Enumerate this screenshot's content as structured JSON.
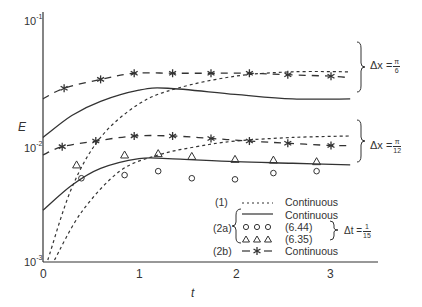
{
  "chart_data": {
    "type": "line",
    "title": "",
    "xlabel": "t",
    "ylabel": "E",
    "yscale": "log",
    "xlim": [
      0,
      3.6
    ],
    "ylim": [
      0.001,
      0.1
    ],
    "x_ticks": [
      "0",
      "1",
      "2",
      "3"
    ],
    "y_ticks": [
      "10^-3",
      "10^-2",
      "10^-1"
    ],
    "grid": false,
    "groups": [
      {
        "label": "Δx = π/6",
        "series": [
          {
            "name": "(1) Continuous",
            "style": "dotted",
            "x": [
              0.05,
              0.3,
              0.6,
              1.0,
              1.4,
              2.0,
              2.6,
              3.2
            ],
            "y": [
              0.001,
              0.004,
              0.0105,
              0.02,
              0.027,
              0.034,
              0.037,
              0.037
            ]
          },
          {
            "name": "(2a) Continuous",
            "style": "solid",
            "x": [
              0.0,
              0.3,
              0.6,
              1.0,
              1.3,
              2.0,
              2.6,
              3.2
            ],
            "y": [
              0.0105,
              0.016,
              0.021,
              0.026,
              0.027,
              0.024,
              0.022,
              0.022
            ]
          },
          {
            "name": "(2b) Continuous",
            "style": "dashed-star",
            "x": [
              0.0,
              0.22,
              0.6,
              0.95,
              1.35,
              1.75,
              2.15,
              2.55,
              3.0,
              3.2
            ],
            "y": [
              0.022,
              0.027,
              0.032,
              0.036,
              0.036,
              0.036,
              0.036,
              0.035,
              0.034,
              0.033
            ]
          }
        ]
      },
      {
        "label": "Δx = π/12",
        "series": [
          {
            "name": "(1) Continuous",
            "style": "dotted",
            "x": [
              0.12,
              0.4,
              0.8,
              1.2,
              1.6,
              2.0,
              2.6,
              3.2
            ],
            "y": [
              0.001,
              0.0025,
              0.0055,
              0.0075,
              0.0088,
              0.0098,
              0.0105,
              0.0108
            ]
          },
          {
            "name": "(2a) Continuous",
            "style": "solid",
            "x": [
              0.0,
              0.3,
              0.6,
              1.0,
              1.3,
              2.0,
              2.6,
              3.2
            ],
            "y": [
              0.0026,
              0.0042,
              0.0058,
              0.007,
              0.007,
              0.0066,
              0.0064,
              0.0062
            ]
          },
          {
            "name": "(2a) (6.44)",
            "style": "circle",
            "x": [
              0.4,
              0.85,
              1.2,
              1.55,
              2.0,
              2.4,
              2.85
            ],
            "y": [
              0.0048,
              0.0051,
              0.0055,
              0.0048,
              0.0047,
              0.0053,
              0.0055
            ]
          },
          {
            "name": "(2a) (6.35)",
            "style": "triangle",
            "x": [
              0.35,
              0.85,
              1.2,
              1.55,
              2.0,
              2.4,
              2.85
            ],
            "y": [
              0.0062,
              0.0075,
              0.0077,
              0.0073,
              0.0069,
              0.0068,
              0.0066
            ]
          },
          {
            "name": "(2b) Continuous",
            "style": "dashed-star",
            "x": [
              0.0,
              0.2,
              0.55,
              0.95,
              1.35,
              1.75,
              2.15,
              2.55,
              3.0,
              3.2
            ],
            "y": [
              0.0075,
              0.0088,
              0.0098,
              0.0108,
              0.0108,
              0.0103,
              0.0098,
              0.0094,
              0.009,
              0.009
            ]
          }
        ]
      }
    ]
  },
  "axes": {
    "y_ticks": [
      {
        "base": "10",
        "exp": "-1"
      },
      {
        "base": "10",
        "exp": "-2"
      },
      {
        "base": "10",
        "exp": "-3"
      }
    ],
    "x_ticks": [
      "0",
      "1",
      "2",
      "3"
    ],
    "x_label": "t",
    "y_label": "E"
  },
  "annotations": {
    "group1": {
      "prefix": "Δx =",
      "num": "π",
      "den": "6"
    },
    "group2": {
      "prefix": "Δx =",
      "num": "π",
      "den": "12"
    },
    "dt": {
      "prefix": "Δt =",
      "num": "1",
      "den": "15"
    }
  },
  "legend": {
    "rows": [
      {
        "id": "(1)",
        "symbol": "......",
        "text": "Continuous"
      },
      {
        "id": "(2a)",
        "symbol": "solid",
        "text": "Continuous"
      },
      {
        "id": "",
        "symbol": "o o o",
        "text": "(6.44)"
      },
      {
        "id": "",
        "symbol": "Δ Δ Δ",
        "text": "(6.35)"
      },
      {
        "id": "(2b)",
        "symbol": "- * -",
        "text": "Continuous"
      }
    ]
  },
  "colors": {
    "ink": "#333333",
    "background": "#ffffff"
  }
}
